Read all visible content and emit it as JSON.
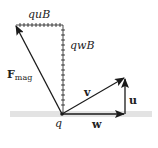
{
  "diagram": {
    "labels": {
      "quB": "quB",
      "qwB": "qwB",
      "F": "F",
      "F_sub": "mag",
      "v": "v",
      "u": "u",
      "w": "w",
      "q": "q"
    },
    "colors": {
      "stroke": "#1a1a1a",
      "band": "#e3e3e3",
      "text": "#222222"
    }
  }
}
